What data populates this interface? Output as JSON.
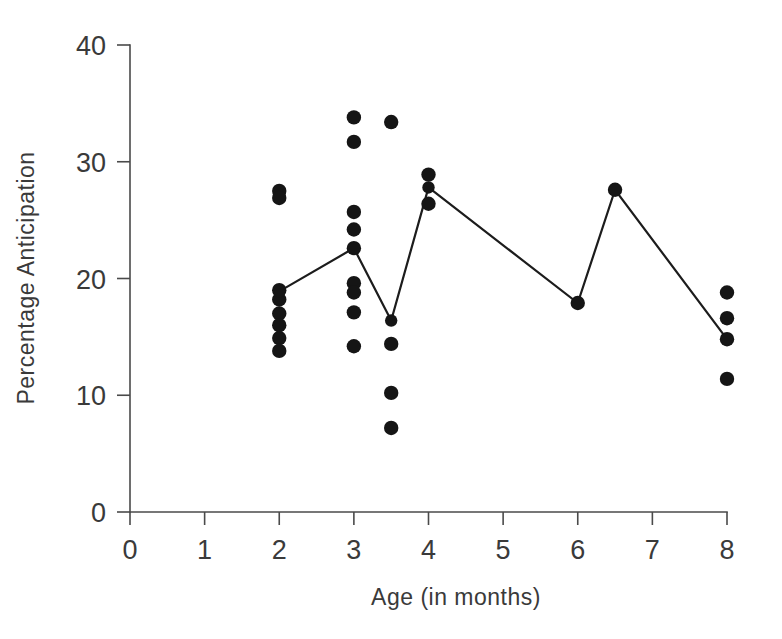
{
  "figure": {
    "background_color": "#ffffff",
    "ink_color": "#1c1c1c",
    "axis_color": "#4a4a4a"
  },
  "chart_data": {
    "type": "scatter",
    "title": "",
    "xlabel": "Age (in months)",
    "ylabel": "Percentage Anticipation",
    "xlim": [
      0,
      8
    ],
    "ylim": [
      0,
      40
    ],
    "xticks": [
      0,
      1,
      2,
      3,
      4,
      5,
      6,
      7,
      8
    ],
    "xtick_labels": [
      "0",
      "1",
      "2",
      "3",
      "4",
      "5",
      "6",
      "7",
      "8"
    ],
    "yticks": [
      0,
      10,
      20,
      30,
      40
    ],
    "ytick_labels": [
      "0",
      "10",
      "20",
      "30",
      "40"
    ],
    "grid": false,
    "legend": false,
    "series": [
      {
        "name": "Individual infants",
        "type": "scatter",
        "marker": "filled-circle",
        "color": "#151515",
        "points": [
          {
            "x": 2,
            "y": 27.5
          },
          {
            "x": 2,
            "y": 26.9
          },
          {
            "x": 2,
            "y": 19.0
          },
          {
            "x": 2,
            "y": 18.2
          },
          {
            "x": 2,
            "y": 17.0
          },
          {
            "x": 2,
            "y": 16.0
          },
          {
            "x": 2,
            "y": 14.9
          },
          {
            "x": 2,
            "y": 13.8
          },
          {
            "x": 3,
            "y": 33.8
          },
          {
            "x": 3,
            "y": 31.7
          },
          {
            "x": 3,
            "y": 25.7
          },
          {
            "x": 3,
            "y": 24.2
          },
          {
            "x": 3,
            "y": 22.6
          },
          {
            "x": 3,
            "y": 19.6
          },
          {
            "x": 3,
            "y": 18.8
          },
          {
            "x": 3,
            "y": 17.1
          },
          {
            "x": 3,
            "y": 14.2
          },
          {
            "x": 3.5,
            "y": 33.4
          },
          {
            "x": 3.5,
            "y": 14.4
          },
          {
            "x": 3.5,
            "y": 10.2
          },
          {
            "x": 3.5,
            "y": 7.2
          },
          {
            "x": 4,
            "y": 28.9
          },
          {
            "x": 4,
            "y": 26.4
          },
          {
            "x": 6,
            "y": 17.9
          },
          {
            "x": 6.5,
            "y": 27.6
          },
          {
            "x": 8,
            "y": 18.8
          },
          {
            "x": 8,
            "y": 16.6
          },
          {
            "x": 8,
            "y": 14.8
          },
          {
            "x": 8,
            "y": 11.4
          }
        ]
      },
      {
        "name": "Mean trend",
        "type": "line",
        "color": "#1c1c1c",
        "points": [
          {
            "x": 2,
            "y": 18.9
          },
          {
            "x": 3,
            "y": 22.6
          },
          {
            "x": 3.5,
            "y": 16.4
          },
          {
            "x": 4,
            "y": 27.8
          },
          {
            "x": 6,
            "y": 17.9
          },
          {
            "x": 6.5,
            "y": 27.6
          },
          {
            "x": 8,
            "y": 14.8
          }
        ]
      }
    ]
  }
}
